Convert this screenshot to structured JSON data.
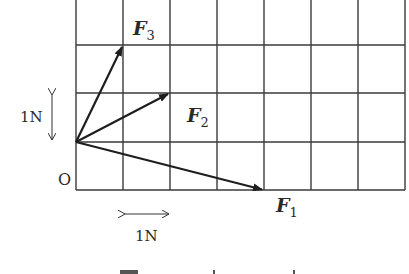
{
  "diagram": {
    "type": "vector-grid",
    "grid": {
      "columns": 7,
      "rows_visible": 4,
      "cell_size_px": 47,
      "line_color": "#3a3a3a"
    },
    "origin": {
      "label": "O",
      "grid_pos": [
        0,
        0
      ]
    },
    "vectors": [
      {
        "id": "F1",
        "symbol": "F",
        "subscript": "1",
        "components": [
          4,
          -1
        ]
      },
      {
        "id": "F2",
        "symbol": "F",
        "subscript": "2",
        "components": [
          2,
          1
        ]
      },
      {
        "id": "F3",
        "symbol": "F",
        "subscript": "3",
        "components": [
          1,
          2
        ]
      }
    ],
    "scale": {
      "vertical": {
        "label": "1N"
      },
      "horizontal": {
        "label": "1N"
      }
    },
    "caption": {
      "visible": "partially cut off at bottom edge"
    }
  }
}
